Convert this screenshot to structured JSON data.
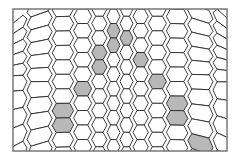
{
  "diagram": {
    "type": "cell-lattice",
    "frame": {
      "x": 13,
      "y": 9,
      "width": 214,
      "height": 142
    },
    "colors": {
      "background": "#ffffff",
      "cell_fill": "#ffffff",
      "shaded_fill": "#b8b8b8",
      "stroke": "#2a2a2a",
      "frame_stroke": "#6e6e6e"
    },
    "lattice": {
      "center_x": 120,
      "rows": 11,
      "row_height": 14.5,
      "cols_each_side": 9,
      "center_col_width": 13,
      "col_growth": 1.18
    },
    "chevron": {
      "apex_x": 120,
      "apex_y": 30,
      "base_left_x": 48,
      "base_right_x": 198,
      "base_y": 140
    }
  }
}
